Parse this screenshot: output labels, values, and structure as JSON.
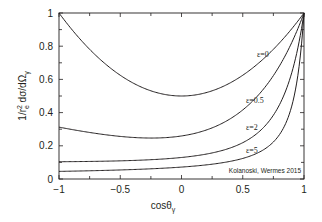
{
  "chart_data": {
    "type": "line",
    "title": "",
    "xlabel": "cosθγ",
    "ylabel": "1/r_e² dσ/dΩγ",
    "xlim": [
      -1,
      1
    ],
    "ylim": [
      0,
      1
    ],
    "x_ticks": [
      -1,
      -0.5,
      0,
      0.5,
      1
    ],
    "x_tick_labels": [
      "−1",
      "−0.5",
      "0",
      "0.5",
      "1"
    ],
    "y_ticks": [
      0,
      0.2,
      0.4,
      0.6,
      0.8,
      1
    ],
    "y_tick_labels": [
      "0",
      "0.2",
      "0.4",
      "0.6",
      "0.8",
      "1"
    ],
    "grid": false,
    "legend": "inline curve labels",
    "x": [
      -1,
      -0.75,
      -0.5,
      -0.25,
      0,
      0.25,
      0.5,
      0.75,
      1
    ],
    "series": [
      {
        "name": "ε=0",
        "values": [
          1.0,
          0.781,
          0.625,
          0.531,
          0.5,
          0.531,
          0.625,
          0.781,
          1.0
        ]
      },
      {
        "name": "ε=0.5",
        "values": [
          0.313,
          0.281,
          0.262,
          0.252,
          0.259,
          0.293,
          0.416,
          0.622,
          1.0
        ]
      },
      {
        "name": "ε=2",
        "values": [
          0.104,
          0.107,
          0.111,
          0.118,
          0.13,
          0.156,
          0.219,
          0.39,
          1.0
        ]
      },
      {
        "name": "ε=5",
        "values": [
          0.046,
          0.05,
          0.055,
          0.062,
          0.072,
          0.09,
          0.124,
          0.228,
          1.0
        ]
      }
    ],
    "annotations": [
      "Kolanoski, Wermes 2015"
    ]
  },
  "labels": {
    "xlabel_main": "cosθ",
    "xlabel_sub": "γ",
    "ylabel": "1/r²e dσ/dΩγ",
    "credit": "Kolanoski, Wermes 2015",
    "curve_labels": [
      "ε=0",
      "ε=0.5",
      "ε=2",
      "ε=5"
    ]
  }
}
